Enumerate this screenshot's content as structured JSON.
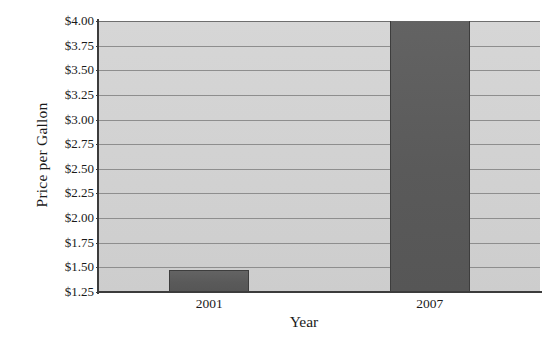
{
  "chart_data": {
    "type": "bar",
    "title": "",
    "xlabel": "Year",
    "ylabel": "Price per Gallon",
    "categories": [
      "2001",
      "2007"
    ],
    "values": [
      1.47,
      4.02
    ],
    "series": [
      {
        "name": "Price per Gallon",
        "values": [
          1.47,
          4.02
        ]
      }
    ],
    "ylim": [
      1.25,
      4.05
    ],
    "ytick_labels": [
      "$4.00",
      "$3.75",
      "$3.50",
      "$3.25",
      "$3.00",
      "$2.75",
      "$2.50",
      "$2.25",
      "$2.00",
      "$1.75",
      "$1.50",
      "$1.25"
    ],
    "ytick_values": [
      4.0,
      3.75,
      3.5,
      3.25,
      3.0,
      2.75,
      2.5,
      2.25,
      2.0,
      1.75,
      1.5,
      1.25
    ],
    "grid": true,
    "grid_axis": "y",
    "legend": false,
    "legend_position": "none",
    "bar_color": "#5e5e5e",
    "bar_edge_color": "#3d3d3d",
    "plot_background": "#d4d4d4",
    "gridline_color": "#8e8e8e",
    "axis_color": "#3c3c3c",
    "text_color": "#1a1a1a"
  }
}
